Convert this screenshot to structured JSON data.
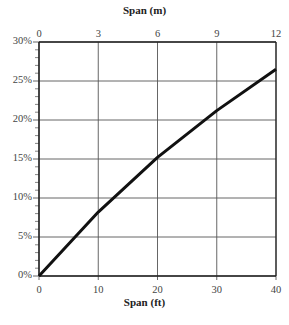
{
  "chart_data": {
    "type": "line",
    "title": "",
    "xlabel": "Span (ft)",
    "x2label": "Span (m)",
    "ylabel": "",
    "x": [
      0,
      10,
      20,
      30,
      40
    ],
    "series": [
      {
        "name": "curve",
        "values": [
          0,
          8.2,
          15.2,
          21.2,
          26.5
        ]
      }
    ],
    "xlim": [
      0,
      40
    ],
    "ylim": [
      0,
      30
    ],
    "x_ticks": [
      "0",
      "10",
      "20",
      "30",
      "40"
    ],
    "x2_ticks": [
      "0",
      "3",
      "6",
      "9",
      "12"
    ],
    "y_ticks": [
      "0%",
      "5%",
      "10%",
      "15%",
      "20%",
      "25%",
      "30%"
    ],
    "grid": true,
    "legend": "none"
  }
}
